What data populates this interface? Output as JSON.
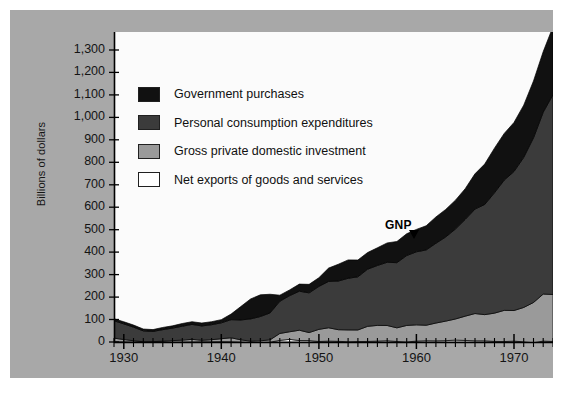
{
  "figure": {
    "background_color": "#a8a8a8",
    "plot_background_color": "#fbfbfb",
    "axis_color": "#000000"
  },
  "axes": {
    "ylabel": "Billions of dollars",
    "y_ticks": [
      "0",
      "100",
      "200",
      "300",
      "400",
      "500",
      "600",
      "700",
      "800",
      "900",
      "1,000",
      "1,100",
      "1,200",
      "1,300"
    ],
    "x_ticks": [
      "1930",
      "1940",
      "1950",
      "1960",
      "1970"
    ]
  },
  "legend": {
    "items": [
      {
        "label": "Government purchases",
        "color": "#111111"
      },
      {
        "label": "Personal consumption expenditures",
        "color": "#3b3b3b"
      },
      {
        "label": "Gross private domestic investment",
        "color": "#9a9a9a"
      },
      {
        "label": "Net exports of goods and services",
        "color": "#ffffff"
      }
    ]
  },
  "annotations": {
    "gnp": "GNP"
  },
  "chart_data": {
    "type": "area",
    "title": "",
    "subtitle": "",
    "xlabel": "",
    "ylabel": "Billions of dollars",
    "xlim": [
      1929,
      1974
    ],
    "ylim": [
      0,
      1380
    ],
    "ytick_values": [
      0,
      100,
      200,
      300,
      400,
      500,
      600,
      700,
      800,
      900,
      1000,
      1100,
      1200,
      1300
    ],
    "xtick_values": [
      1930,
      1940,
      1950,
      1960,
      1970
    ],
    "x_minor_tick_step": 1,
    "grid": false,
    "legend_position": "inside-upper-left",
    "stacked": true,
    "stack_order_bottom_to_top": [
      "Net exports of goods and services",
      "Gross private domestic investment",
      "Personal consumption expenditures",
      "Government purchases"
    ],
    "x": [
      1929,
      1930,
      1931,
      1932,
      1933,
      1934,
      1935,
      1936,
      1937,
      1938,
      1939,
      1940,
      1941,
      1942,
      1943,
      1944,
      1945,
      1946,
      1947,
      1948,
      1949,
      1950,
      1951,
      1952,
      1953,
      1954,
      1955,
      1956,
      1957,
      1958,
      1959,
      1960,
      1961,
      1962,
      1963,
      1964,
      1965,
      1966,
      1967,
      1968,
      1969,
      1970,
      1971,
      1972,
      1973,
      1974
    ],
    "series": [
      {
        "name": "Net exports of goods and services",
        "color": "#ffffff",
        "values": [
          1.1,
          0.7,
          0.2,
          0.2,
          0.1,
          0.4,
          -0.2,
          -0.1,
          0.1,
          1.1,
          0.9,
          1.5,
          1.0,
          -0.2,
          -2.2,
          -2.0,
          -0.8,
          7.3,
          11.6,
          6.5,
          6.3,
          2.2,
          4.0,
          2.9,
          1.2,
          2.0,
          2.4,
          4.0,
          5.7,
          2.2,
          0.1,
          4.0,
          5.6,
          5.1,
          5.9,
          8.5,
          6.9,
          5.3,
          5.2,
          2.5,
          1.9,
          3.9,
          0.6,
          -3.4,
          4.0,
          2.1
        ]
      },
      {
        "name": "Gross private domestic investment",
        "color": "#9a9a9a",
        "values": [
          16.2,
          10.3,
          5.5,
          0.9,
          1.4,
          3.3,
          6.4,
          8.5,
          11.8,
          6.5,
          9.3,
          13.1,
          17.9,
          9.9,
          5.8,
          7.2,
          10.6,
          30.7,
          34.0,
          46.0,
          35.7,
          54.1,
          59.3,
          51.9,
          52.6,
          51.7,
          67.4,
          70.0,
          67.9,
          60.9,
          73.6,
          72.4,
          69.0,
          79.4,
          87.1,
          94.0,
          108.1,
          121.4,
          116.6,
          126.0,
          139.0,
          136.3,
          153.2,
          179.3,
          209.4,
          209.4
        ]
      },
      {
        "name": "Personal consumption expenditures",
        "color": "#3b3b3b",
        "values": [
          77.2,
          69.9,
          60.5,
          48.6,
          45.8,
          51.3,
          55.7,
          61.9,
          66.5,
          63.9,
          66.8,
          70.8,
          80.6,
          88.5,
          99.3,
          108.3,
          119.7,
          143.4,
          160.7,
          173.6,
          176.8,
          191.0,
          206.3,
          216.7,
          230.0,
          236.5,
          254.4,
          266.7,
          281.4,
          290.1,
          311.2,
          325.2,
          335.2,
          355.1,
          374.6,
          400.5,
          430.4,
          465.1,
          490.4,
          535.9,
          579.7,
          618.8,
          668.2,
          733.0,
          809.9,
          889.6
        ]
      },
      {
        "name": "Government purchases",
        "color": "#111111",
        "values": [
          8.8,
          9.3,
          9.3,
          8.0,
          8.0,
          9.8,
          10.0,
          12.0,
          11.9,
          13.0,
          13.3,
          14.1,
          24.8,
          59.7,
          88.6,
          96.5,
          83.0,
          27.0,
          25.5,
          31.6,
          37.8,
          38.8,
          59.4,
          74.7,
          81.6,
          74.8,
          74.2,
          78.6,
          86.1,
          94.2,
          97.0,
          99.6,
          107.6,
          117.1,
          122.5,
          128.3,
          137.0,
          156.8,
          180.1,
          198.6,
          207.9,
          218.2,
          232.4,
          253.1,
          269.5,
          302.7
        ]
      }
    ],
    "total_gnp": [
      104.4,
      91.1,
      76.3,
      58.5,
      56.0,
      65.0,
      72.5,
      82.7,
      90.8,
      85.2,
      91.1,
      100.6,
      125.8,
      159.1,
      192.7,
      211.4,
      213.4,
      212.4,
      235.2,
      261.6,
      260.4,
      288.3,
      333.4,
      351.6,
      371.6,
      372.5,
      405.9,
      428.2,
      451.0,
      456.8,
      495.8,
      515.3,
      533.8,
      574.6,
      606.9,
      649.8,
      705.1,
      772.0,
      816.4,
      892.7,
      963.9,
      982.4,
      1063.4,
      1171.1,
      1306.6,
      1412.9
    ],
    "annotations": [
      {
        "text": "GNP",
        "x": 1958,
        "y": 520,
        "points_to": "top-boundary"
      }
    ]
  }
}
